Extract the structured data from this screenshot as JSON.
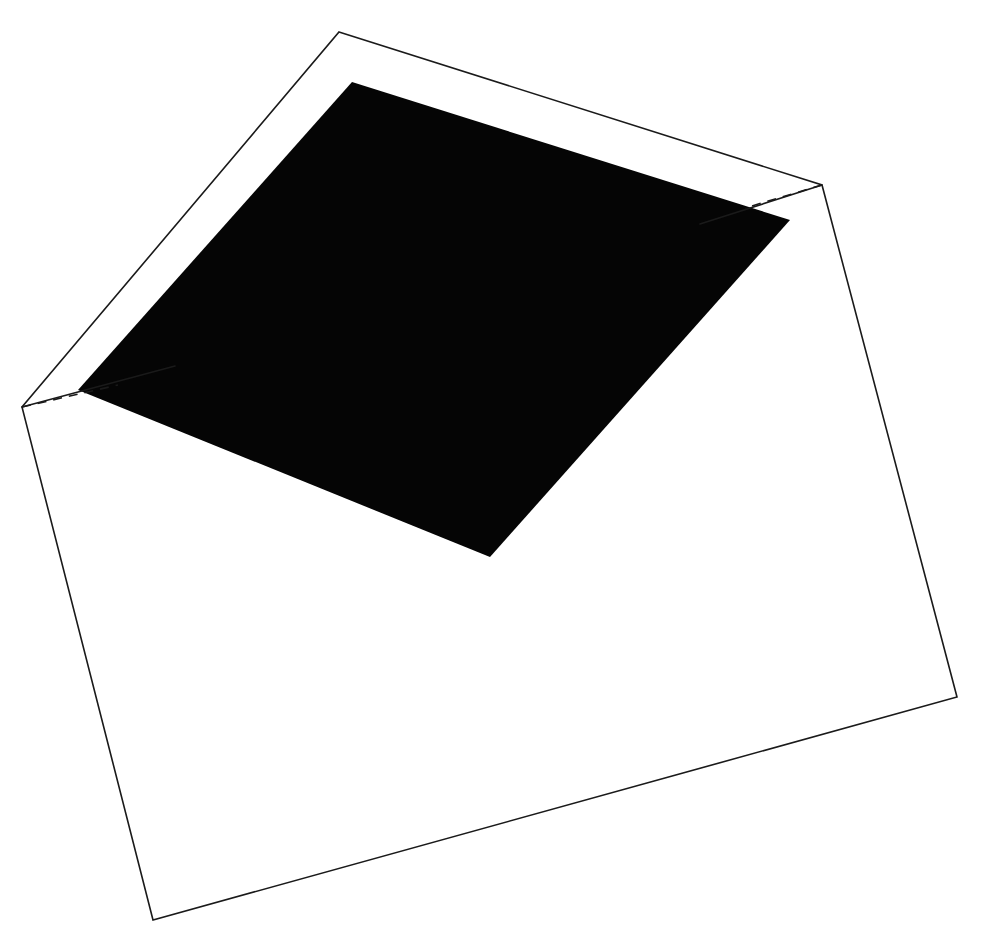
{
  "figure": {
    "canvas": {
      "width": 983,
      "height": 925,
      "background_color": "#ffffff"
    },
    "colors": {
      "background": "#ffffff",
      "stroke": "#1a1a1a",
      "fill_dark": "#050505",
      "fill_light": "#ffffff"
    },
    "stroke_width": 1.6,
    "dash_pattern": "9 7"
  },
  "shapes": {
    "outer_body": {
      "name": "envelope-outer-body",
      "kind": "polygon",
      "fill": "#ffffff",
      "stroke": "#1a1a1a",
      "points": "339,32 822,185 957,697 153,920 22,407",
      "vertices": [
        {
          "label": "top",
          "x": 339,
          "y": 32
        },
        {
          "label": "right",
          "x": 822,
          "y": 185
        },
        {
          "label": "bottom-right",
          "x": 957,
          "y": 697
        },
        {
          "label": "bottom-left",
          "x": 153,
          "y": 920
        },
        {
          "label": "left",
          "x": 22,
          "y": 407
        }
      ]
    },
    "inner_opening": {
      "name": "envelope-inner-opening",
      "kind": "polygon",
      "fill": "#050505",
      "points": "352,82 790,220 490,557 78,390",
      "vertices": [
        {
          "label": "top",
          "x": 352,
          "y": 82
        },
        {
          "label": "right",
          "x": 790,
          "y": 220
        },
        {
          "label": "bottom",
          "x": 490,
          "y": 557
        },
        {
          "label": "left",
          "x": 78,
          "y": 390
        }
      ]
    },
    "fold_edge_left": {
      "name": "fold-edge-left",
      "kind": "line",
      "points": "22,407 175,366",
      "from": {
        "x": 22,
        "y": 407
      },
      "to": {
        "x": 175,
        "y": 366
      }
    },
    "fold_edge_right": {
      "name": "fold-edge-right",
      "kind": "line",
      "points": "822,185 700,224",
      "from": {
        "x": 822,
        "y": 185
      },
      "to": {
        "x": 700,
        "y": 224
      }
    },
    "hidden_edge_left": {
      "name": "hidden-edge-left",
      "kind": "dashed-line",
      "points": "22,407 118,385",
      "from": {
        "x": 22,
        "y": 407
      },
      "to": {
        "x": 118,
        "y": 385
      }
    },
    "hidden_edge_right": {
      "name": "hidden-edge-right",
      "kind": "dashed-line",
      "points": "822,185 745,208",
      "from": {
        "x": 822,
        "y": 185
      },
      "to": {
        "x": 745,
        "y": 208
      }
    }
  }
}
